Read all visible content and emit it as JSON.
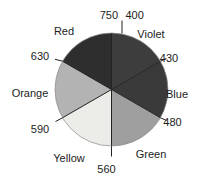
{
  "figure": {
    "width": 203,
    "height": 182,
    "background": "#ffffff",
    "text_color": "#1c1c1c",
    "line_color": "#222222",
    "outline_color": "#8a8a8a",
    "font_size": 11,
    "center_x": 111.5,
    "center_y": 89.5,
    "radius": 56.5
  },
  "chart_data": {
    "type": "pie",
    "sectors": [
      {
        "label": "Violet",
        "wavelength_nm": [
          400,
          430
        ],
        "angle_start": 0,
        "angle_end": 60,
        "fill": "#3d3d3d",
        "label_x": 151,
        "label_y": 38
      },
      {
        "label": "Blue",
        "wavelength_nm": [
          430,
          480
        ],
        "angle_start": 60,
        "angle_end": 120,
        "fill": "#3a3a3a",
        "label_x": 177,
        "label_y": 98
      },
      {
        "label": "Green",
        "wavelength_nm": [
          480,
          560
        ],
        "angle_start": 120,
        "angle_end": 180,
        "fill": "#9f9f9f",
        "label_x": 151,
        "label_y": 158
      },
      {
        "label": "Yellow",
        "wavelength_nm": [
          560,
          590
        ],
        "angle_start": 180,
        "angle_end": 240,
        "fill": "#ecece8",
        "label_x": 69,
        "label_y": 162
      },
      {
        "label": "Orange",
        "wavelength_nm": [
          590,
          630
        ],
        "angle_start": 240,
        "angle_end": 300,
        "fill": "#b3b3b3",
        "label_x": 30,
        "label_y": 97
      },
      {
        "label": "Red",
        "wavelength_nm": [
          630,
          750
        ],
        "angle_start": 300,
        "angle_end": 360,
        "fill": "#2e2e2e",
        "label_x": 64,
        "label_y": 35
      }
    ],
    "boundaries": [
      {
        "angle": 0,
        "tick": {
          "x1": 122,
          "y1": 20.5,
          "x2": 122,
          "y2": 33.5
        },
        "labels": [
          {
            "text": "750",
            "x": 118,
            "y": 19,
            "anchor": "end"
          },
          {
            "text": "400",
            "x": 125.5,
            "y": 19,
            "anchor": "start"
          }
        ]
      },
      {
        "angle": 60,
        "tick": {
          "x1": 159.5,
          "y1": 61.8,
          "x2": 166.5,
          "y2": 58.3
        },
        "labels": [
          {
            "text": "430",
            "x": 169,
            "y": 62,
            "anchor": "middle"
          }
        ]
      },
      {
        "angle": 120,
        "tick": {
          "x1": 159.5,
          "y1": 117.3,
          "x2": 166.5,
          "y2": 120.5
        },
        "labels": [
          {
            "text": "480",
            "x": 172.5,
            "y": 126,
            "anchor": "middle"
          }
        ]
      },
      {
        "angle": 180,
        "tick": {
          "x1": 111.5,
          "y1": 145.5,
          "x2": 111.5,
          "y2": 156.5
        },
        "labels": [
          {
            "text": "560",
            "x": 106.5,
            "y": 173,
            "anchor": "middle"
          }
        ]
      },
      {
        "angle": 240,
        "tick": {
          "x1": 63,
          "y1": 117.5,
          "x2": 55.5,
          "y2": 121.5
        },
        "labels": [
          {
            "text": "590",
            "x": 40,
            "y": 133,
            "anchor": "middle"
          }
        ]
      },
      {
        "angle": 300,
        "tick": {
          "x1": 63,
          "y1": 61.3,
          "x2": 55,
          "y2": 59.3
        },
        "labels": [
          {
            "text": "630",
            "x": 40,
            "y": 60,
            "anchor": "middle"
          }
        ]
      }
    ]
  }
}
